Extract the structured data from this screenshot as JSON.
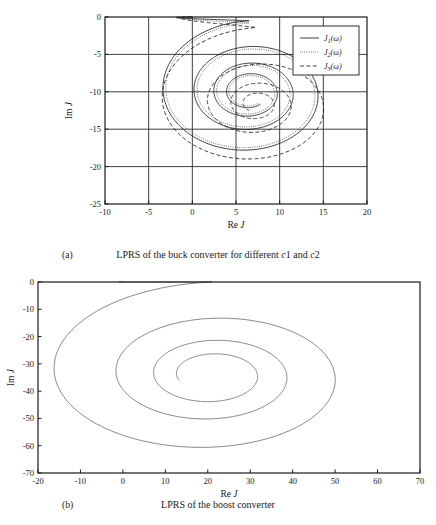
{
  "figure": {
    "panels": [
      {
        "letter": "(a)",
        "caption_prefix": "LPRS of the buck converter for different ",
        "caption_c1": "c",
        "caption_c1_num": "1",
        "caption_mid": " and ",
        "caption_c2": "c",
        "caption_c2_num": "2"
      },
      {
        "letter": "(b)",
        "caption": "LPRS of the boost converter"
      }
    ]
  },
  "chart_data": [
    {
      "type": "line",
      "id": "buck-lprs",
      "title": "",
      "xlabel_prefix": "Re ",
      "xlabel_italic": "J",
      "ylabel_prefix": "Im ",
      "ylabel_italic": "J",
      "xlim": [
        -10,
        20
      ],
      "ylim": [
        -25,
        0
      ],
      "xticks": [
        -10,
        -5,
        0,
        5,
        10,
        15,
        20
      ],
      "yticks": [
        0,
        -5,
        -10,
        -15,
        -20,
        -25
      ],
      "xticklabels": [
        "-10",
        "-5",
        "0",
        "5",
        "10",
        "15",
        "20"
      ],
      "yticklabels": [
        "0",
        "-5",
        "-10",
        "-15",
        "-20",
        "-25"
      ],
      "grid": true,
      "legend_position": "upper-right",
      "series": [
        {
          "name": "J1(w)",
          "label_base": "J",
          "label_sub": "1",
          "label_arg": "(ω)",
          "style": "solid",
          "start": [
            0,
            0
          ],
          "focus": [
            6.5,
            -10.1
          ],
          "leftmost_re": -4.9,
          "rightmost_re": 16.6,
          "lowest_im": -17.9,
          "spiral": {
            "r0x": 11.0,
            "r0y": 9.6,
            "theta0": 1.5708,
            "turns": 3.6,
            "decay": 0.8,
            "aspect": 0.5
          }
        },
        {
          "name": "J2(w)",
          "label_base": "J",
          "label_sub": "2",
          "label_arg": "(ω)",
          "style": "dotted",
          "start": [
            0,
            0
          ],
          "focus": [
            6.5,
            -10.1
          ],
          "leftmost_re": -4.7,
          "rightmost_re": 16.3,
          "lowest_im": -18.2,
          "spiral": {
            "r0x": 10.7,
            "r0y": 9.3,
            "theta0": 1.5708,
            "turns": 3.6,
            "decay": 0.79,
            "aspect": 0.52
          }
        },
        {
          "name": "J3(w)",
          "label_base": "J",
          "label_sub": "3",
          "label_arg": "(ω)",
          "style": "dashed",
          "start": [
            0,
            0
          ],
          "focus": [
            7.3,
            -11.6
          ],
          "leftmost_re": -4.1,
          "rightmost_re": 19.2,
          "lowest_im": -20.6,
          "spiral": {
            "r0x": 12.6,
            "r0y": 10.2,
            "theta0": 1.5708,
            "turns": 3.4,
            "decay": 0.72,
            "aspect": 0.5
          }
        }
      ]
    },
    {
      "type": "line",
      "id": "boost-lprs",
      "title": "",
      "xlabel_prefix": "Re ",
      "xlabel_italic": "J",
      "ylabel_prefix": "Im ",
      "ylabel_italic": "J",
      "xlim": [
        -20,
        70
      ],
      "ylim": [
        -70,
        0
      ],
      "xticks": [
        -20,
        -10,
        0,
        10,
        20,
        30,
        40,
        50,
        60,
        70
      ],
      "yticks": [
        0,
        -10,
        -20,
        -30,
        -40,
        -50,
        -60,
        -70
      ],
      "xticklabels": [
        "-20",
        "-10",
        "0",
        "10",
        "20",
        "30",
        "40",
        "50",
        "60",
        "70"
      ],
      "yticklabels": [
        "0",
        "-10",
        "-20",
        "-30",
        "-40",
        "-50",
        "-60",
        "-70"
      ],
      "grid": false,
      "legend_position": "none",
      "series": [
        {
          "name": "boost",
          "style": "solid",
          "start": [
            0,
            0
          ],
          "focus": [
            21.0,
            -34.0
          ],
          "leftmost_re": -5.2,
          "rightmost_re": 63.5,
          "lowest_im": -67.8,
          "spiral": {
            "r0x": 42.0,
            "r0y": 34.0,
            "theta0": 1.5708,
            "turns": 3.3,
            "decay": 0.78,
            "aspect": 0.4
          }
        }
      ]
    }
  ]
}
